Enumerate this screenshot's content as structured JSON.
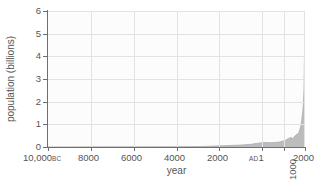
{
  "chart_data": {
    "type": "area",
    "title": "",
    "xlabel": "year",
    "ylabel": "population (billions)",
    "xlim": [
      -10000,
      2000
    ],
    "ylim": [
      0,
      6
    ],
    "grid": true,
    "legend": "none",
    "series_color": "#bcbcbc",
    "axis_color": "#6e6e6e",
    "grid_color": "#e2e2e2",
    "plot_background": "#fcfcfc",
    "y_ticks": [
      "0",
      "1",
      "2",
      "3",
      "4",
      "5",
      "6"
    ],
    "y_tick_values": [
      0,
      1,
      2,
      3,
      4,
      5,
      6
    ],
    "x_ticks": [
      {
        "label": "10,000",
        "suffix": "BC",
        "value": -10000,
        "rotated": false
      },
      {
        "label": "8000",
        "suffix": "",
        "value": -8000,
        "rotated": false
      },
      {
        "label": "6000",
        "suffix": "",
        "value": -6000,
        "rotated": false
      },
      {
        "label": "4000",
        "suffix": "",
        "value": -4000,
        "rotated": false
      },
      {
        "label": "2000",
        "suffix": "",
        "value": -2000,
        "rotated": false
      },
      {
        "label": "1",
        "prefix": "AD",
        "value": 1,
        "rotated": false
      },
      {
        "label": "1000",
        "suffix": "",
        "value": 1000,
        "rotated": true
      },
      {
        "label": "2000",
        "suffix": "",
        "value": 2000,
        "rotated": false
      }
    ],
    "x": [
      -10000,
      -9000,
      -8000,
      -7000,
      -6000,
      -5000,
      -4000,
      -3000,
      -2500,
      -2000,
      -1500,
      -1000,
      -800,
      -500,
      -400,
      -200,
      1,
      200,
      400,
      600,
      800,
      1000,
      1100,
      1200,
      1300,
      1340,
      1400,
      1500,
      1600,
      1700,
      1750,
      1800,
      1850,
      1900,
      1920,
      1930,
      1940,
      1950,
      1960,
      1970,
      1980,
      1990,
      2000
    ],
    "values": [
      0.004,
      0.005,
      0.006,
      0.007,
      0.008,
      0.01,
      0.015,
      0.02,
      0.03,
      0.05,
      0.065,
      0.085,
      0.1,
      0.12,
      0.14,
      0.17,
      0.19,
      0.2,
      0.19,
      0.2,
      0.22,
      0.27,
      0.3,
      0.36,
      0.4,
      0.44,
      0.35,
      0.45,
      0.55,
      0.6,
      0.75,
      0.9,
      1.2,
      1.6,
      1.86,
      2.07,
      2.3,
      2.5,
      3.0,
      3.7,
      4.4,
      5.3,
      6.0
    ],
    "annotation": "World population is nearly flat near zero from 10,000 BC until about AD 1, then rises exponentially, reaching roughly 2 billion at the right edge of the drawn area."
  }
}
